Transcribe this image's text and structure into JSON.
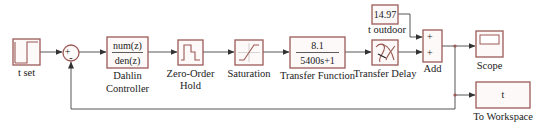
{
  "diagram": {
    "type": "simulink-block-diagram",
    "blocks": {
      "step": {
        "label": "t set",
        "kind": "step",
        "icon": "step-icon"
      },
      "sum": {
        "signs": [
          "+",
          "-"
        ],
        "kind": "sum"
      },
      "controller": {
        "label_line1": "Dahlin",
        "label_line2": "Controller",
        "numerator": "num(z)",
        "denominator": "den(z)",
        "kind": "discrete-transfer-fcn"
      },
      "zoh": {
        "label_line1": "Zero-Order",
        "label_line2": "Hold",
        "kind": "zero-order-hold",
        "icon": "zoh-staircase-icon"
      },
      "saturation": {
        "label": "Saturation",
        "kind": "saturation",
        "icon": "saturation-icon"
      },
      "plant": {
        "label": "Transfer Function",
        "numerator": "8.1",
        "denominator": "5400s+1",
        "kind": "transfer-fcn"
      },
      "delay": {
        "label": "Transfer Delay",
        "kind": "transport-delay",
        "icon": "transport-delay-icon"
      },
      "constant": {
        "label": "t outdoor",
        "value": "14.97",
        "kind": "constant"
      },
      "add": {
        "label": "Add",
        "signs": [
          "+",
          "+"
        ],
        "kind": "add"
      },
      "scope": {
        "label": "Scope",
        "kind": "scope",
        "icon": "scope-screen-icon"
      },
      "workspace": {
        "label": "To Workspace",
        "variable": "t",
        "kind": "to-workspace"
      }
    },
    "connections": [
      [
        "t set",
        "sum+"
      ],
      [
        "sum",
        "Dahlin Controller"
      ],
      [
        "Dahlin Controller",
        "Zero-Order Hold"
      ],
      [
        "Zero-Order Hold",
        "Saturation"
      ],
      [
        "Saturation",
        "Transfer Function"
      ],
      [
        "Transfer Function",
        "Transfer Delay"
      ],
      [
        "t outdoor",
        "Add+1"
      ],
      [
        "Transfer Delay",
        "Add+2"
      ],
      [
        "Add",
        "Scope"
      ],
      [
        "Add",
        "To Workspace"
      ],
      [
        "Add",
        "sum- (feedback)"
      ]
    ],
    "colors": {
      "block_border": "#9b5a56",
      "wire": "#444444",
      "background": "#ffffff"
    }
  }
}
